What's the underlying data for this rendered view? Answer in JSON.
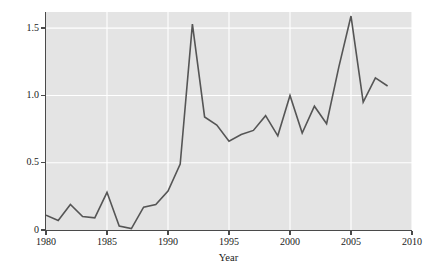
{
  "chart_data": {
    "type": "line",
    "title": "",
    "xlabel": "Year",
    "ylabel": "Biodiversity aid (billions 2000 U.S. dollars)",
    "xlim": [
      1980,
      2010
    ],
    "ylim": [
      0,
      1.62
    ],
    "xticks": [
      1980,
      1985,
      1990,
      1995,
      2000,
      2005,
      2010
    ],
    "xtick_labels": [
      "1980",
      "1985",
      "1990",
      "1995",
      "2000",
      "2005",
      "2010"
    ],
    "yticks": [
      0,
      0.5,
      1.0,
      1.5
    ],
    "ytick_labels": [
      "0",
      "0.5",
      "1.0",
      "1.5"
    ],
    "grid": true,
    "grid_color": "#ffffff",
    "plot_bgcolor": "#e4e4e4",
    "figure_bgcolor": "#ffffff",
    "line_color": "#555555",
    "line_width": 1.6,
    "legend": null,
    "x": [
      1980,
      1981,
      1982,
      1983,
      1984,
      1985,
      1986,
      1987,
      1988,
      1989,
      1990,
      1991,
      1992,
      1993,
      1994,
      1995,
      1996,
      1997,
      1998,
      1999,
      2000,
      2001,
      2002,
      2003,
      2004,
      2005,
      2006,
      2007,
      2008
    ],
    "values": [
      0.11,
      0.07,
      0.19,
      0.1,
      0.09,
      0.28,
      0.03,
      0.01,
      0.17,
      0.19,
      0.29,
      0.49,
      1.53,
      0.84,
      0.78,
      0.66,
      0.71,
      0.74,
      0.85,
      0.7,
      1.0,
      0.72,
      0.92,
      0.79,
      1.21,
      1.59,
      0.95,
      1.13,
      1.07
    ],
    "series": [
      {
        "name": "Biodiversity aid",
        "values": [
          0.11,
          0.07,
          0.19,
          0.1,
          0.09,
          0.28,
          0.03,
          0.01,
          0.17,
          0.19,
          0.29,
          0.49,
          1.53,
          0.84,
          0.78,
          0.66,
          0.71,
          0.74,
          0.85,
          0.7,
          1.0,
          0.72,
          0.92,
          0.79,
          1.21,
          1.59,
          0.95,
          1.13,
          1.07
        ]
      }
    ],
    "annotations": []
  }
}
